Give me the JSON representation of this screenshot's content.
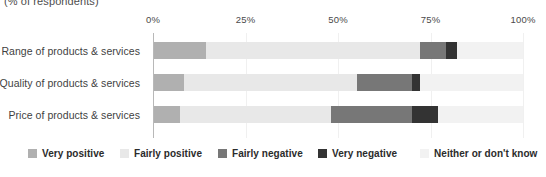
{
  "subtitle": "(% of respondents)",
  "chart_data": {
    "type": "bar",
    "subtype": "stacked-horizontal-100",
    "title": "",
    "subtitle": "(% of respondents)",
    "xlabel": "",
    "ylabel": "",
    "xlim": [
      0,
      100
    ],
    "grid": true,
    "legend_position": "bottom",
    "axis_ticks": [
      "0%",
      "25%",
      "50%",
      "75%",
      "100%"
    ],
    "axis_tick_values": [
      0,
      25,
      50,
      75,
      100
    ],
    "categories": [
      "Range of products & services",
      "Quality of products & services",
      "Price of products & services"
    ],
    "series": [
      {
        "name": "Very positive",
        "color": "#b0b0b0",
        "values": [
          14,
          8,
          7
        ]
      },
      {
        "name": "Fairly positive",
        "color": "#e8e8e8",
        "values": [
          58,
          47,
          41
        ]
      },
      {
        "name": "Fairly negative",
        "color": "#777777",
        "values": [
          7,
          15,
          22
        ]
      },
      {
        "name": "Very negative",
        "color": "#333333",
        "values": [
          3,
          2,
          7
        ]
      },
      {
        "name": "Neither or don't know",
        "color": "#f2f2f2",
        "values": [
          18,
          28,
          23
        ]
      }
    ]
  },
  "legend": {
    "items": [
      {
        "label": "Very positive",
        "color": "#b0b0b0"
      },
      {
        "label": "Fairly positive",
        "color": "#e8e8e8"
      },
      {
        "label": "Fairly negative",
        "color": "#777777"
      },
      {
        "label": "Very negative",
        "color": "#333333"
      },
      {
        "label": "Neither or don't know",
        "color": "#f2f2f2"
      }
    ]
  }
}
